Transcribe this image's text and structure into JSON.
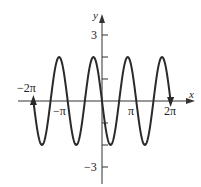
{
  "chart_data": {
    "type": "line",
    "title": "",
    "function": "y = -2 sin(2x)",
    "xlabel": "x",
    "ylabel": "y",
    "xlim": [
      -6.2832,
      6.2832
    ],
    "ylim": [
      -3,
      3
    ],
    "x_ticks": [
      {
        "value": -6.2832,
        "label": "−2π"
      },
      {
        "value": -3.1416,
        "label": "−π"
      },
      {
        "value": 3.1416,
        "label": "π"
      },
      {
        "value": 6.2832,
        "label": "2π"
      }
    ],
    "y_ticks": [
      {
        "value": 3,
        "label": "3"
      },
      {
        "value": 2,
        "label": ""
      },
      {
        "value": 1,
        "label": ""
      },
      {
        "value": -1,
        "label": ""
      },
      {
        "value": -2,
        "label": ""
      },
      {
        "value": -3,
        "label": "−3"
      }
    ],
    "series": [
      {
        "name": "curve",
        "amplitude": 2,
        "period": 3.1416,
        "endpoints": "arrows at both ends"
      }
    ],
    "grid": false,
    "legend": null
  },
  "labels": {
    "x_axis": "x",
    "y_axis": "y",
    "neg_2pi": "−2π",
    "neg_pi": "−π",
    "pi": "π",
    "two_pi": "2π",
    "y_3": "3",
    "y_neg3": "−3"
  }
}
